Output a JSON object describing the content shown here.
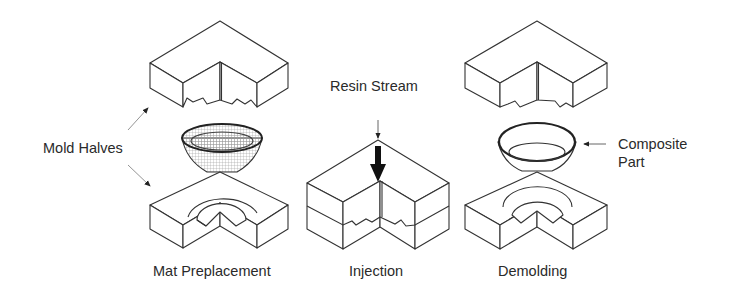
{
  "diagram": {
    "labels": {
      "mold_halves": "Mold Halves",
      "resin_stream": "Resin Stream",
      "composite_part_line1": "Composite",
      "composite_part_line2": "Part"
    },
    "stages": [
      {
        "id": "mat-preplacement",
        "caption": "Mat Preplacement"
      },
      {
        "id": "injection",
        "caption": "Injection"
      },
      {
        "id": "demolding",
        "caption": "Demolding"
      }
    ],
    "colors": {
      "line": "#333333",
      "text": "#2a2a2a",
      "background": "#ffffff",
      "mesh": "#9a9a9a"
    }
  }
}
